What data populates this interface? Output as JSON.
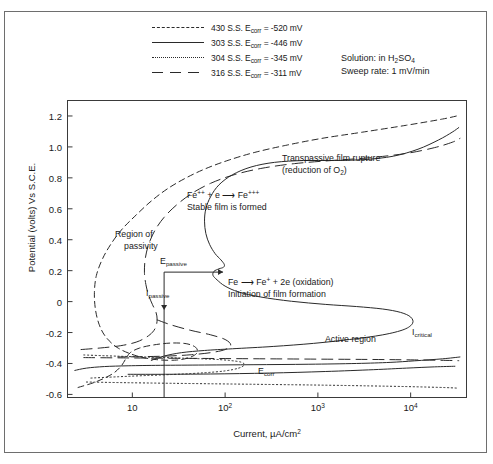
{
  "figure": {
    "border_color": "#6e6e6e",
    "background": "#ffffff"
  },
  "legend": {
    "entries": [
      {
        "label": "430 S.S. Ecorr = -520 mV",
        "alloy": "430 S.S.",
        "ecorr_mv": -520,
        "style": "dashed"
      },
      {
        "label": "303 S.S. Ecorr = -446 mV",
        "alloy": "303 S.S.",
        "ecorr_mv": -446,
        "style": "solid"
      },
      {
        "label": "304 S.S. Ecorr = -345 mV",
        "alloy": "304 S.S.",
        "ecorr_mv": -345,
        "style": "dotted"
      },
      {
        "label": "316 S.S. Ecorr = -311 mV",
        "alloy": "316 S.S.",
        "ecorr_mv": -311,
        "style": "longdash"
      }
    ]
  },
  "notes": {
    "solution": "Solution: in H2SO4",
    "solution_prefix": "Solution: in H",
    "solution_sub": "2",
    "solution_mid": "SO",
    "solution_sub2": "4",
    "sweep_rate": "Sweep rate: 1 mV/min"
  },
  "annotations": [
    {
      "id": "transpassive",
      "line1": "Transpassive film rupture",
      "line2": "(reduction of O2)"
    },
    {
      "id": "stable-film",
      "line1": "Fe++ + e ——> Fe+++",
      "line2": "Stable film is formed"
    },
    {
      "id": "oxidation",
      "line1": "Fe ——> Fe+ + 2e (oxidation)",
      "line2": "Initiation of film formation"
    },
    {
      "id": "region-of-passivity",
      "line1": "Region of",
      "line2": "passivity"
    },
    {
      "id": "e-passive",
      "label": "Epassive",
      "base": "E",
      "sub": "passive"
    },
    {
      "id": "i-passive",
      "label": "Ipassive",
      "base": "I",
      "sub": "passive"
    },
    {
      "id": "i-critical",
      "label": "Icritical",
      "base": "I",
      "sub": "critical"
    },
    {
      "id": "active-region",
      "label": "Active region"
    },
    {
      "id": "e-corr",
      "label": "Ecorr",
      "base": "E",
      "sub": "corr"
    }
  ],
  "chart_data": {
    "type": "line",
    "title": "",
    "xlabel": "Current, µA/cm2",
    "xlabel_base": "Current, µA/cm",
    "xlabel_sup": "2",
    "ylabel": "Potential (volts) Vs S.C.E.",
    "xscale": "log",
    "xlim": [
      2,
      40000
    ],
    "ylim": [
      -0.62,
      1.3
    ],
    "xticks": [
      10,
      100,
      1000,
      10000
    ],
    "xticklabels": [
      "10",
      "10²",
      "10³",
      "10⁴"
    ],
    "xtick_bases": [
      "10",
      "10",
      "10",
      "10"
    ],
    "xtick_sups": [
      "",
      "2",
      "3",
      "4"
    ],
    "yticks": [
      1.2,
      1.0,
      0.8,
      0.6,
      0.4,
      0.2,
      0,
      -0.2,
      -0.4,
      -0.6
    ],
    "yticklabels": [
      "1.2",
      "1.0",
      "0.8",
      "0.6",
      "0.4",
      "0.2",
      "0",
      "-0.2",
      "-0.4",
      "-0.6"
    ],
    "grid": false,
    "legend_position": "above-plot",
    "series": [
      {
        "name": "430 S.S.",
        "style": "dashed",
        "ecorr_mv": -520,
        "comment": "anodic polarization loop: current vs potential (x=current uA/cm2, y=volts)",
        "points": [
          [
            2.6,
            -0.555
          ],
          [
            4.0,
            -0.52
          ],
          [
            6.0,
            -0.47
          ],
          [
            7.5,
            -0.42
          ],
          [
            8.5,
            -0.37
          ],
          [
            9.5,
            -0.33
          ],
          [
            12.0,
            -0.3
          ],
          [
            17.0,
            -0.28
          ],
          [
            26.0,
            -0.268
          ],
          [
            38.0,
            -0.272
          ],
          [
            48.0,
            -0.295
          ],
          [
            50.0,
            -0.33
          ],
          [
            42.0,
            -0.36
          ],
          [
            30.0,
            -0.378
          ],
          [
            18.0,
            -0.375
          ],
          [
            11.0,
            -0.35
          ],
          [
            7.0,
            -0.3
          ],
          [
            5.2,
            -0.23
          ],
          [
            4.4,
            -0.15
          ],
          [
            4.0,
            -0.05
          ],
          [
            3.9,
            0.06
          ],
          [
            4.1,
            0.17
          ],
          [
            4.8,
            0.28
          ],
          [
            6.0,
            0.38
          ],
          [
            7.8,
            0.47
          ],
          [
            11.0,
            0.56
          ],
          [
            16.0,
            0.65
          ],
          [
            24.0,
            0.73
          ],
          [
            38.0,
            0.8
          ],
          [
            62.0,
            0.86
          ],
          [
            110.0,
            0.915
          ],
          [
            210.0,
            0.965
          ],
          [
            450.0,
            1.01
          ],
          [
            1100.0,
            1.055
          ],
          [
            3000.0,
            1.095
          ],
          [
            9000.0,
            1.14
          ],
          [
            22000.0,
            1.18
          ],
          [
            34000.0,
            1.205
          ]
        ]
      },
      {
        "name": "303 S.S.",
        "style": "solid",
        "ecorr_mv": -446,
        "points": [
          [
            2.4,
            -0.445
          ],
          [
            3.2,
            -0.43
          ],
          [
            5.0,
            -0.42
          ],
          [
            9.0,
            -0.415
          ],
          [
            20.0,
            -0.412
          ],
          [
            60.0,
            -0.41
          ],
          [
            200.0,
            -0.408
          ],
          [
            800.0,
            -0.405
          ],
          [
            2600.0,
            -0.4
          ],
          [
            6000.0,
            -0.393
          ],
          [
            11000.0,
            -0.383
          ],
          [
            22000.0,
            -0.37
          ],
          [
            34000.0,
            -0.358
          ]
        ]
      },
      {
        "name": "303 S.S. anodic",
        "style": "solid",
        "ecorr_mv": -446,
        "points": [
          [
            9.0,
            -0.47
          ],
          [
            20.0,
            -0.47
          ],
          [
            70.0,
            -0.468
          ],
          [
            300.0,
            -0.462
          ],
          [
            1200.0,
            -0.452
          ],
          [
            4000.0,
            -0.44
          ],
          [
            9000.0,
            -0.43
          ],
          [
            18000.0,
            -0.422
          ],
          [
            30000.0,
            -0.418
          ]
        ]
      },
      {
        "name": "303 S.S. main loop",
        "style": "solid",
        "ecorr_mv": -446,
        "points": [
          [
            16.0,
            -0.38
          ],
          [
            22.0,
            -0.352
          ],
          [
            34.0,
            -0.33
          ],
          [
            60.0,
            -0.316
          ],
          [
            120.0,
            -0.305
          ],
          [
            330.0,
            -0.29
          ],
          [
            900.0,
            -0.27
          ],
          [
            2200.0,
            -0.245
          ],
          [
            5000.0,
            -0.215
          ],
          [
            8500.0,
            -0.18
          ],
          [
            10500.0,
            -0.14
          ],
          [
            10000.0,
            -0.1
          ],
          [
            7800.0,
            -0.07
          ],
          [
            5000.0,
            -0.048
          ],
          [
            2600.0,
            -0.032
          ],
          [
            1200.0,
            -0.018
          ],
          [
            520.0,
            0.002
          ],
          [
            240.0,
            0.03
          ],
          [
            140.0,
            0.062
          ],
          [
            100.0,
            0.1
          ],
          [
            82.0,
            0.14
          ],
          [
            74.0,
            0.17
          ],
          [
            76.0,
            0.196
          ],
          [
            86.0,
            0.212
          ],
          [
            96.0,
            0.222
          ],
          [
            98.0,
            0.24
          ],
          [
            90.0,
            0.27
          ],
          [
            78.0,
            0.31
          ],
          [
            68.0,
            0.37
          ],
          [
            62.0,
            0.44
          ],
          [
            60.0,
            0.52
          ],
          [
            62.0,
            0.6
          ],
          [
            70.0,
            0.68
          ],
          [
            86.0,
            0.755
          ],
          [
            120.0,
            0.82
          ],
          [
            190.0,
            0.87
          ],
          [
            340.0,
            0.9
          ],
          [
            700.0,
            0.912
          ],
          [
            1500.0,
            0.912
          ],
          [
            3200.0,
            0.918
          ],
          [
            6500.0,
            0.94
          ],
          [
            12000.0,
            0.985
          ],
          [
            20000.0,
            1.045
          ],
          [
            28000.0,
            1.095
          ],
          [
            33000.0,
            1.125
          ]
        ]
      },
      {
        "name": "304 S.S.",
        "style": "dotted",
        "ecorr_mv": -345,
        "points": [
          [
            3.0,
            -0.345
          ],
          [
            5.0,
            -0.35
          ],
          [
            9.0,
            -0.355
          ],
          [
            18.0,
            -0.36
          ],
          [
            36.0,
            -0.366
          ],
          [
            70.0,
            -0.372
          ],
          [
            110.0,
            -0.38
          ],
          [
            150.0,
            -0.392
          ],
          [
            160.0,
            -0.41
          ],
          [
            140.0,
            -0.43
          ],
          [
            100.0,
            -0.448
          ],
          [
            60.0,
            -0.46
          ],
          [
            30.0,
            -0.47
          ],
          [
            14.0,
            -0.478
          ],
          [
            7.0,
            -0.486
          ],
          [
            3.4,
            -0.495
          ]
        ]
      },
      {
        "name": "304 S.S. lower",
        "style": "dotted",
        "ecorr_mv": -345,
        "points": [
          [
            3.2,
            -0.52
          ],
          [
            8.0,
            -0.524
          ],
          [
            25.0,
            -0.528
          ],
          [
            90.0,
            -0.532
          ],
          [
            320.0,
            -0.536
          ],
          [
            1100.0,
            -0.54
          ],
          [
            3600.0,
            -0.545
          ],
          [
            10000.0,
            -0.55
          ],
          [
            24000.0,
            -0.556
          ],
          [
            33000.0,
            -0.56
          ]
        ]
      },
      {
        "name": "316 S.S.",
        "style": "longdash",
        "ecorr_mv": -311,
        "points": [
          [
            2.8,
            -0.31
          ],
          [
            4.5,
            -0.3
          ],
          [
            7.5,
            -0.285
          ],
          [
            11.0,
            -0.262
          ],
          [
            14.0,
            -0.232
          ],
          [
            16.5,
            -0.198
          ],
          [
            18.0,
            -0.16
          ],
          [
            18.5,
            -0.115
          ],
          [
            18.0,
            -0.07
          ],
          [
            16.5,
            -0.02
          ],
          [
            15.0,
            0.04
          ],
          [
            14.0,
            0.11
          ],
          [
            13.5,
            0.19
          ],
          [
            13.8,
            0.28
          ],
          [
            15.0,
            0.37
          ],
          [
            17.5,
            0.46
          ],
          [
            22.0,
            0.545
          ],
          [
            30.0,
            0.625
          ],
          [
            44.0,
            0.7
          ],
          [
            70.0,
            0.765
          ],
          [
            125.0,
            0.82
          ],
          [
            250.0,
            0.862
          ],
          [
            560.0,
            0.892
          ],
          [
            1400.0,
            0.912
          ],
          [
            3600.0,
            0.93
          ],
          [
            9000.0,
            0.958
          ],
          [
            18000.0,
            0.995
          ],
          [
            28000.0,
            1.03
          ],
          [
            34000.0,
            1.055
          ]
        ]
      },
      {
        "name": "316 S.S. active loop",
        "style": "longdash",
        "ecorr_mv": -311,
        "points": [
          [
            18.5,
            -0.118
          ],
          [
            26.0,
            -0.15
          ],
          [
            42.0,
            -0.185
          ],
          [
            70.0,
            -0.215
          ],
          [
            100.0,
            -0.245
          ],
          [
            115.0,
            -0.28
          ],
          [
            100.0,
            -0.31
          ],
          [
            70.0,
            -0.33
          ],
          [
            42.0,
            -0.344
          ],
          [
            24.0,
            -0.352
          ],
          [
            13.0,
            -0.356
          ],
          [
            7.0,
            -0.358
          ]
        ]
      },
      {
        "name": "316 S.S. cathodic",
        "style": "longdash",
        "ecorr_mv": -311,
        "points": [
          [
            3.0,
            -0.362
          ],
          [
            8.0,
            -0.364
          ],
          [
            24.0,
            -0.366
          ],
          [
            80.0,
            -0.368
          ],
          [
            280.0,
            -0.37
          ],
          [
            1000.0,
            -0.372
          ],
          [
            3600.0,
            -0.374
          ],
          [
            11000.0,
            -0.377
          ],
          [
            24000.0,
            -0.38
          ],
          [
            33000.0,
            -0.382
          ]
        ]
      }
    ],
    "markers": {
      "e_passive_value": 0.21,
      "i_passive_value": 22,
      "i_critical_value": 11000,
      "e_corr_value": -0.45
    }
  }
}
